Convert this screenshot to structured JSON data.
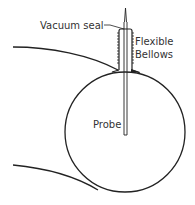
{
  "diagram": {
    "labels": {
      "vacuum_seal": "Vacuum seal",
      "flexible": "Flexible",
      "bellows": "Bellows",
      "probe": "Probe"
    },
    "colors": {
      "line": "#222222",
      "text": "#333333",
      "background": "#ffffff"
    }
  }
}
